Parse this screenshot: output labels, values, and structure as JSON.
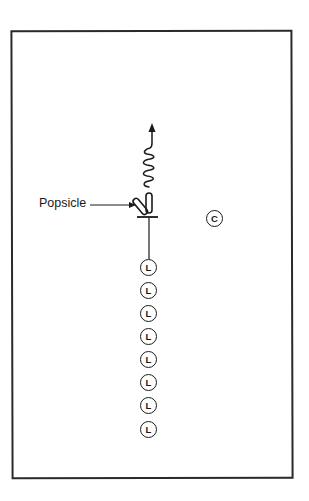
{
  "diagram": {
    "type": "play-diagram",
    "labels": {
      "popsicle": "Popsicle"
    },
    "symbols": {
      "center": "C",
      "line_player": "L"
    },
    "colors": {
      "ink": "#1a1a1a",
      "background": "#ffffff"
    },
    "elements": {
      "popsicle_label": "Popsicle",
      "center_marker": {
        "label": "C",
        "x": 215,
        "y": 219
      },
      "line_players": [
        {
          "label": "L",
          "x": 149,
          "y": 268
        },
        {
          "label": "L",
          "x": 149,
          "y": 291
        },
        {
          "label": "L",
          "x": 149,
          "y": 314
        },
        {
          "label": "L",
          "x": 149,
          "y": 337
        },
        {
          "label": "L",
          "x": 149,
          "y": 360
        },
        {
          "label": "L",
          "x": 149,
          "y": 383
        },
        {
          "label": "L",
          "x": 149,
          "y": 406
        },
        {
          "label": "L",
          "x": 149,
          "y": 430
        }
      ]
    }
  }
}
